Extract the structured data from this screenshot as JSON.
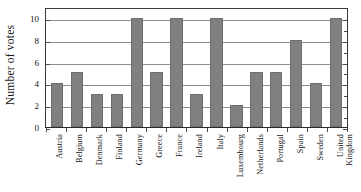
{
  "chart_data": {
    "type": "bar",
    "title": "",
    "xlabel": "",
    "ylabel": "Number of votes",
    "ylim": [
      0,
      11
    ],
    "grid": true,
    "legend": "none",
    "orientation": "vertical",
    "bar_color": "#808080",
    "categories": [
      "Austria",
      "Belgium",
      "Denmark",
      "Finland",
      "Germany",
      "Greece",
      "France",
      "Ireland",
      "Italy",
      "Luxembourg",
      "Netherlands",
      "Portugal",
      "Spain",
      "Sweden",
      "United Kingdom"
    ],
    "category_lines": [
      [
        "Austria"
      ],
      [
        "Belgium"
      ],
      [
        "Denmark"
      ],
      [
        "Finland"
      ],
      [
        "Germany"
      ],
      [
        "Greece"
      ],
      [
        "France"
      ],
      [
        "Ireland"
      ],
      [
        "Italy"
      ],
      [
        "Luxembourg"
      ],
      [
        "Netherlands"
      ],
      [
        "Portugal"
      ],
      [
        "Spain"
      ],
      [
        "Sweden"
      ],
      [
        "United",
        "Kingdom"
      ]
    ],
    "values": [
      4,
      5,
      3,
      3,
      10,
      5,
      10,
      3,
      10,
      2,
      5,
      5,
      8,
      4,
      10
    ],
    "ytick_labels": [
      "0",
      "2",
      "4",
      "6",
      "8",
      "10"
    ],
    "ytick_values": [
      0,
      2,
      4,
      6,
      8,
      10
    ]
  }
}
